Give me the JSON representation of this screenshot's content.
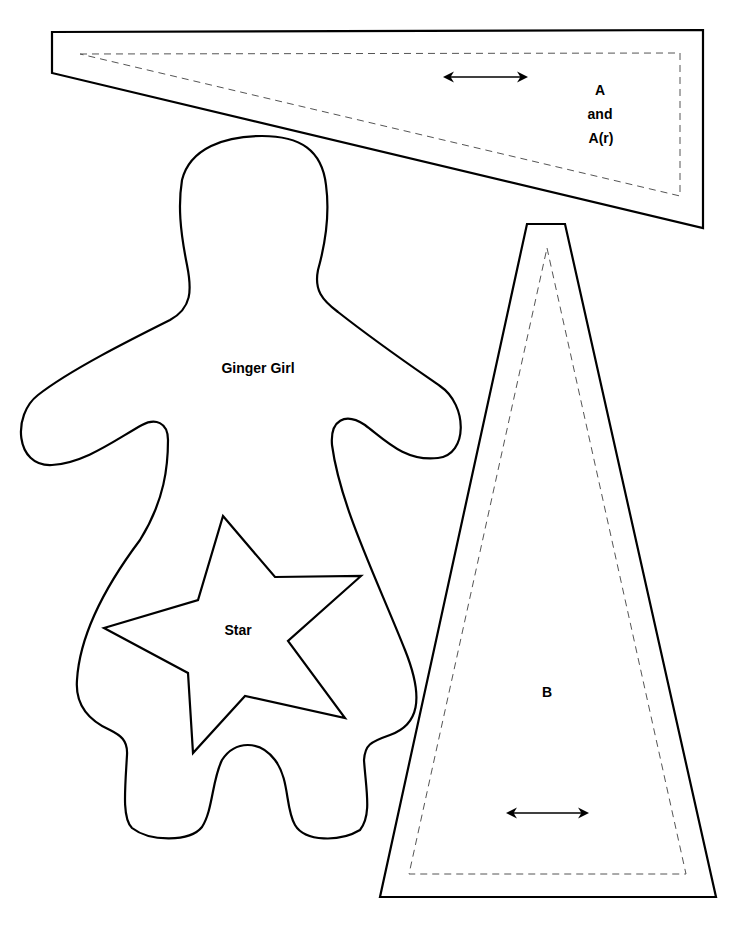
{
  "pattern_sheet": {
    "pieces": {
      "a": {
        "label_line1": "A",
        "label_line2": "and",
        "label_line3": "A(r)",
        "grainline": "horizontal double arrow"
      },
      "b": {
        "label": "B",
        "grainline": "horizontal double arrow"
      },
      "ginger_girl": {
        "label": "Ginger Girl"
      },
      "star": {
        "label": "Star"
      }
    },
    "legend": {
      "solid_line": "cutting line",
      "dashed_line": "seam line"
    },
    "colors": {
      "line": "#000000",
      "seam": "#555555",
      "background": "#ffffff"
    }
  }
}
